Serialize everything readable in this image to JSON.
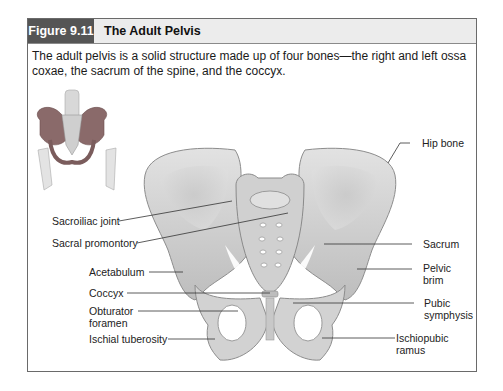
{
  "figure": {
    "number": "Figure 9.11",
    "title": "The Adult Pelvis",
    "caption": "The adult pelvis is a solid structure made up of four bones—the right and left ossa coxae, the sacrum of the spine, and the coccyx."
  },
  "labels": {
    "left": [
      {
        "id": "sacroiliac-joint",
        "text": "Sacroiliac joint"
      },
      {
        "id": "sacral-promontory",
        "text": "Sacral promontory"
      },
      {
        "id": "acetabulum",
        "text": "Acetabulum"
      },
      {
        "id": "coccyx",
        "text": "Coccyx"
      },
      {
        "id": "obturator-foramen",
        "line1": "Obturator",
        "line2": "foramen"
      },
      {
        "id": "ischial-tuberosity",
        "text": "Ischial tuberosity"
      }
    ],
    "right": [
      {
        "id": "hip-bone",
        "text": "Hip bone"
      },
      {
        "id": "sacrum",
        "text": "Sacrum"
      },
      {
        "id": "pelvic-brim",
        "line1": "Pelvic",
        "line2": "brim"
      },
      {
        "id": "pubic-symphysis",
        "line1": "Pubic",
        "line2": "symphysis"
      },
      {
        "id": "ischiopubic-ramus",
        "line1": "Ischiopubic",
        "line2": "ramus"
      }
    ]
  },
  "colors": {
    "header_dark": "#555555",
    "header_light": "#ececec",
    "bone": "#d4d4d4",
    "bone_shadow": "#a9a9a9",
    "border": "#6a6a6a"
  }
}
